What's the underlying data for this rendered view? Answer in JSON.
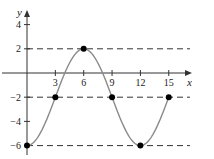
{
  "chart_data": {
    "type": "line",
    "title": "",
    "xlabel": "x",
    "ylabel": "y",
    "xlim": [
      0,
      16.5
    ],
    "ylim": [
      -6.5,
      5
    ],
    "x_ticks": [
      3,
      6,
      9,
      12,
      15
    ],
    "x_tick_labels": [
      "3",
      "6",
      "9",
      "12",
      "15"
    ],
    "y_ticks": [
      4,
      2,
      -2,
      -4,
      -6
    ],
    "y_tick_labels": [
      "4",
      "2",
      "−2",
      "−4",
      "−6"
    ],
    "grid": false,
    "legend": null,
    "function": "y = -2 - 4cos(πx/6)",
    "series": [
      {
        "name": "curve",
        "x": [
          0,
          3,
          6,
          9,
          12,
          15
        ],
        "y": [
          -6,
          -2,
          2,
          -2,
          -6,
          -2
        ]
      }
    ],
    "marked_points": [
      {
        "x": 0,
        "y": -6
      },
      {
        "x": 3,
        "y": -2
      },
      {
        "x": 6,
        "y": 2
      },
      {
        "x": 9,
        "y": -2
      },
      {
        "x": 12,
        "y": -6
      },
      {
        "x": 15,
        "y": -2
      }
    ],
    "dashed_reference_lines": [
      {
        "y": 2
      },
      {
        "y": -2
      },
      {
        "y": -6
      }
    ],
    "colors": {
      "curve": "#8a8a8a",
      "axes": "#333333",
      "dashed": "#333333",
      "points": "#000000"
    }
  }
}
